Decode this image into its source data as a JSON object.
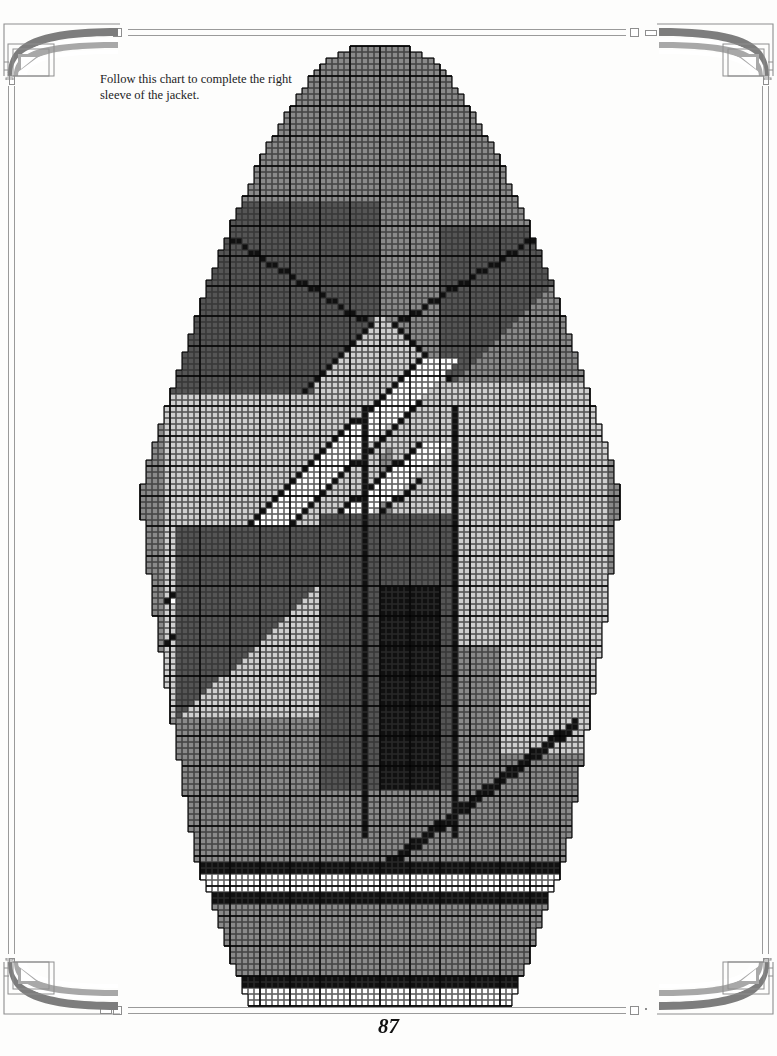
{
  "page": {
    "number": "87",
    "width": 777,
    "height": 1056,
    "background": "#fdfdfc"
  },
  "caption": {
    "text": "Follow this chart to complete the right sleeve of the jacket."
  },
  "ornaments": {
    "style_name": "art-nouveau-corner-fan",
    "color_dark": "#7d7d7d",
    "color_mid": "#a8a8a8",
    "color_light": "#c9c9c9",
    "rule_color": "#9a9a9a"
  },
  "chart_data": {
    "type": "heatmap",
    "grid": {
      "columns": 80,
      "rows": 160,
      "cell_px": 6,
      "origin_x": 140,
      "origin_y": 46,
      "minor_line_color": "#303030",
      "minor_line_width": 0.7,
      "major_line_color": "#000000",
      "major_line_width": 1.4,
      "major_every": 5,
      "grid_on": true
    },
    "legend": {
      "position": "none",
      "entries": [
        {
          "key": "K",
          "name": "black",
          "color": "#101010"
        },
        {
          "key": "D",
          "name": "dark-gray",
          "color": "#555555"
        },
        {
          "key": "M",
          "name": "medium-gray",
          "color": "#8a8a8a"
        },
        {
          "key": "L",
          "name": "light-gray",
          "color": "#cfcfcf"
        },
        {
          "key": "W",
          "name": "white",
          "color": "#ffffff"
        },
        {
          "key": ".",
          "name": "empty-no-stitch",
          "color": null
        }
      ]
    },
    "shape": {
      "note": "Sleeve silhouette: narrow cast-on cuff, flaring body, widest at the upper arm, tapering to a pointed sleeve cap.",
      "outline_by_row": "generated from taper parameters below",
      "taper": {
        "cap_top_row": 0,
        "cap_top_half_width": 5,
        "cap_bottom_row": 74,
        "shoulder_half_width": 40,
        "underarm_row": 92,
        "underarm_half_width": 38,
        "cuff_top_row": 134,
        "cuff_top_half_width": 31,
        "cuff_bottom_row": 159,
        "cuff_bottom_half_width": 22
      }
    },
    "motifs": [
      {
        "name": "cap-field",
        "color_key": "M",
        "rows": [
          0,
          28
        ],
        "note": "Solid medium-gray at the very top of the sleeve cap."
      },
      {
        "name": "upper-chevron-outline",
        "color_key": "K",
        "note": "Two black diagonals descending from the cap shoulders, meeting in a V near row 42."
      },
      {
        "name": "upper-left-dark-wedge",
        "color_key": "D",
        "rows": [
          28,
          48
        ],
        "note": "Dark-gray triangular wedge left of the chevron."
      },
      {
        "name": "upper-right-dark-wedge",
        "color_key": "D",
        "rows": [
          28,
          52
        ],
        "note": "Dark-gray triangular wedge right of the chevron."
      },
      {
        "name": "central-light-diamond",
        "color_key": "L",
        "rows": [
          40,
          60
        ],
        "note": "Light-gray diamond framed by the chevron arms."
      },
      {
        "name": "white-diagonal-band",
        "color_key": "W",
        "rows": [
          52,
          92
        ],
        "note": "Wide white band running from lower-left to upper-right, edged in black."
      },
      {
        "name": "second-white-diagonal-band",
        "color_key": "W",
        "rows": [
          62,
          100
        ],
        "note": "Parallel white band below the first."
      },
      {
        "name": "left-dark-triangle",
        "color_key": "D",
        "rows": [
          78,
          112
        ],
        "note": "Large dark-gray triangle on the lower-left of the body."
      },
      {
        "name": "right-light-field",
        "color_key": "L",
        "rows": [
          60,
          120
        ],
        "note": "Broad light-gray field filling the right half of the body."
      },
      {
        "name": "center-black-block",
        "color_key": "K",
        "rows": [
          90,
          124
        ],
        "columns": [
          40,
          50
        ],
        "note": "Solid black rectangle at centre of the lower body."
      },
      {
        "name": "vertical-black-stripes",
        "color_key": "K",
        "columns": [
          37,
          52
        ],
        "note": "Two single-stitch vertical black stripes flanking the black block."
      },
      {
        "name": "lower-right-diagonal",
        "color_key": "K",
        "rows": [
          112,
          136
        ],
        "note": "Black diagonal sweeping down to the right edge above the cuff."
      },
      {
        "name": "cuff-stripe-upper",
        "color_key": "K",
        "rows": [
          136,
          138
        ],
        "note": "Black horizontal welt stripe at the top of the cuff."
      },
      {
        "name": "cuff-white-row",
        "color_key": "W",
        "rows": [
          138,
          141
        ],
        "note": "White rows between the two black welt stripes."
      },
      {
        "name": "cuff-stripe-lower",
        "color_key": "K",
        "rows": [
          141,
          143
        ],
        "note": "Second black welt stripe."
      },
      {
        "name": "cuff-body",
        "color_key": "M",
        "rows": [
          143,
          155
        ],
        "note": "Medium-gray ribbed cuff body."
      },
      {
        "name": "cuff-caston-stripe",
        "color_key": "K",
        "rows": [
          155,
          157
        ],
        "note": "Black stripe just above the cast-on edge."
      },
      {
        "name": "cuff-caston-white",
        "color_key": "W",
        "rows": [
          157,
          160
        ],
        "note": "White cast-on rows at the very bottom."
      }
    ]
  }
}
